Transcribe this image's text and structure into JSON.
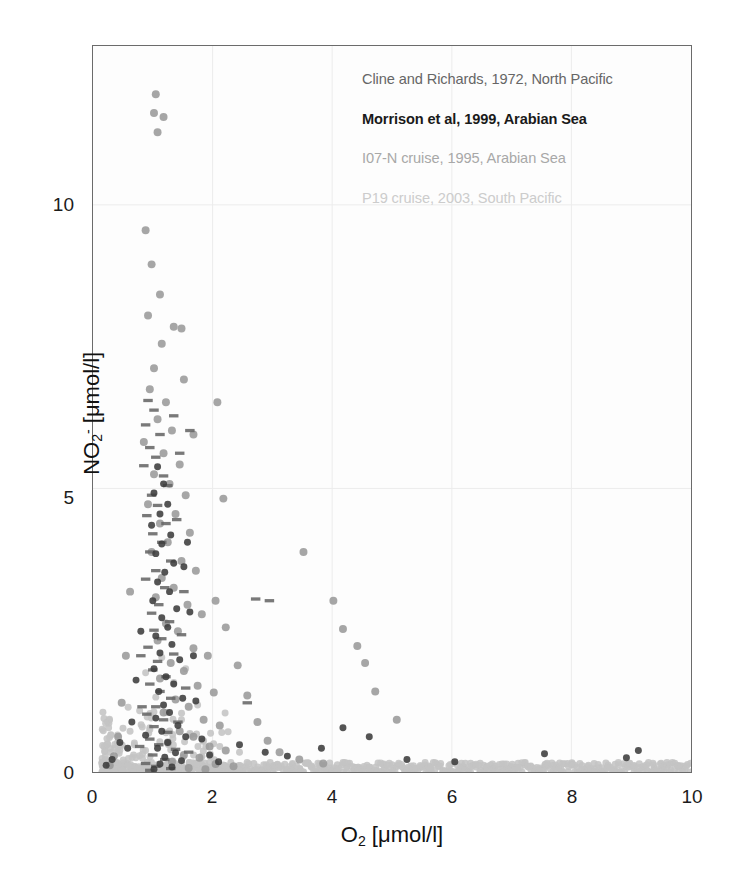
{
  "figure": {
    "background": "#ffffff",
    "plot_background": "#fdfdfd",
    "frame_color": "#6b6b6b"
  },
  "axes": {
    "x_tick_labels": [
      "0",
      "2",
      "4",
      "6",
      "8",
      "10"
    ],
    "y_tick_labels": [
      "0",
      "5",
      "10"
    ],
    "x_title_main": "O",
    "x_title_sub": "2",
    "x_title_unit": " [μmol/l]",
    "y_title_main": "NO",
    "y_title_sub": "2",
    "y_title_sup": "-",
    "y_title_unit": " [μmol/l]"
  },
  "legend": {
    "entries": [
      {
        "label": "Cline and Richards, 1972, North Pacific",
        "color": "#666666",
        "weight": "normal"
      },
      {
        "label": "Morrison et al, 1999, Arabian Sea",
        "color": "#1a1a1a",
        "weight": "bold"
      },
      {
        "label": "I07-N cruise, 1995, Arabian Sea",
        "color": "#a8a8a8",
        "weight": "normal"
      },
      {
        "label": "P19 cruise, 2003, South Pacific",
        "color": "#cccccc",
        "weight": "normal"
      }
    ]
  },
  "chart_data": {
    "type": "scatter",
    "title": "",
    "xlabel": "O2 [μmol/l]",
    "ylabel": "NO2- [μmol/l]",
    "xlim": [
      0,
      10
    ],
    "ylim": [
      0,
      12.8
    ],
    "grid": true,
    "grid_color": "#ececec",
    "legend_position": "upper-right-inside",
    "series": [
      {
        "name": "Cline and Richards, 1972, North Pacific",
        "color": "#666666",
        "marker": "dash",
        "size": 5,
        "points": [
          [
            0.92,
            6.55
          ],
          [
            1.02,
            6.38
          ],
          [
            0.88,
            6.12
          ],
          [
            1.12,
            5.95
          ],
          [
            0.95,
            5.72
          ],
          [
            1.05,
            5.55
          ],
          [
            0.85,
            5.4
          ],
          [
            1.18,
            5.22
          ],
          [
            1.25,
            5.05
          ],
          [
            0.98,
            4.88
          ],
          [
            1.08,
            4.7
          ],
          [
            0.9,
            4.52
          ],
          [
            1.22,
            4.38
          ],
          [
            1.0,
            4.2
          ],
          [
            1.15,
            4.05
          ],
          [
            0.95,
            3.88
          ],
          [
            1.3,
            3.72
          ],
          [
            1.05,
            3.55
          ],
          [
            0.88,
            3.4
          ],
          [
            1.2,
            3.25
          ],
          [
            2.72,
            3.05
          ],
          [
            2.95,
            3.02
          ],
          [
            1.1,
            2.95
          ],
          [
            0.98,
            2.8
          ],
          [
            1.28,
            2.65
          ],
          [
            1.02,
            2.5
          ],
          [
            1.15,
            2.35
          ],
          [
            0.92,
            2.2
          ],
          [
            1.35,
            2.08
          ],
          [
            1.08,
            1.95
          ],
          [
            1.0,
            1.8
          ],
          [
            1.22,
            1.68
          ],
          [
            0.95,
            1.55
          ],
          [
            1.12,
            1.42
          ],
          [
            1.3,
            1.3
          ],
          [
            2.58,
            1.22
          ],
          [
            1.05,
            1.15
          ],
          [
            0.9,
            1.02
          ],
          [
            1.18,
            0.92
          ],
          [
            1.02,
            0.8
          ],
          [
            1.25,
            0.7
          ],
          [
            0.95,
            0.58
          ],
          [
            1.1,
            0.48
          ],
          [
            1.38,
            0.4
          ],
          [
            1.0,
            0.3
          ],
          [
            1.2,
            0.22
          ],
          [
            0.88,
            0.15
          ],
          [
            1.05,
            0.1
          ],
          [
            1.3,
            0.06
          ],
          [
            0.95,
            0.03
          ],
          [
            1.45,
            5.62
          ],
          [
            1.4,
            4.45
          ],
          [
            1.52,
            3.18
          ],
          [
            1.48,
            2.42
          ],
          [
            1.55,
            1.48
          ],
          [
            1.42,
            0.88
          ],
          [
            1.6,
            0.35
          ],
          [
            0.8,
            2.05
          ],
          [
            0.82,
            1.15
          ],
          [
            0.78,
            0.45
          ],
          [
            1.62,
            6.02
          ],
          [
            1.35,
            6.28
          ]
        ]
      },
      {
        "name": "Morrison et al, 1999, Arabian Sea",
        "color": "#3c3c3c",
        "marker": "circle",
        "size": 7,
        "points": [
          [
            1.08,
            5.38
          ],
          [
            1.18,
            5.08
          ],
          [
            1.02,
            4.92
          ],
          [
            1.25,
            4.72
          ],
          [
            1.12,
            4.55
          ],
          [
            0.98,
            4.35
          ],
          [
            1.3,
            4.18
          ],
          [
            1.15,
            4.02
          ],
          [
            1.05,
            3.85
          ],
          [
            1.35,
            3.68
          ],
          [
            1.2,
            3.52
          ],
          [
            1.08,
            3.35
          ],
          [
            1.28,
            3.18
          ],
          [
            1.0,
            3.02
          ],
          [
            1.4,
            2.88
          ],
          [
            1.15,
            2.72
          ],
          [
            1.25,
            2.55
          ],
          [
            1.05,
            2.4
          ],
          [
            1.32,
            2.25
          ],
          [
            1.12,
            2.1
          ],
          [
            1.45,
            1.98
          ],
          [
            1.02,
            1.82
          ],
          [
            1.22,
            1.68
          ],
          [
            1.35,
            1.55
          ],
          [
            1.1,
            1.42
          ],
          [
            1.5,
            1.3
          ],
          [
            1.18,
            1.18
          ],
          [
            1.28,
            1.05
          ],
          [
            1.05,
            0.95
          ],
          [
            1.42,
            0.82
          ],
          [
            1.15,
            0.72
          ],
          [
            1.55,
            0.62
          ],
          [
            1.25,
            0.52
          ],
          [
            1.08,
            0.42
          ],
          [
            1.38,
            0.34
          ],
          [
            1.2,
            0.26
          ],
          [
            1.48,
            0.2
          ],
          [
            1.12,
            0.14
          ],
          [
            1.32,
            0.09
          ],
          [
            1.02,
            0.05
          ],
          [
            0.72,
            1.62
          ],
          [
            0.65,
            0.88
          ],
          [
            0.58,
            0.42
          ],
          [
            0.8,
            2.48
          ],
          [
            0.88,
            0.65
          ],
          [
            1.68,
            2.05
          ],
          [
            1.72,
            1.25
          ],
          [
            1.82,
            0.58
          ],
          [
            1.95,
            0.3
          ],
          [
            2.1,
            0.18
          ],
          [
            4.18,
            0.78
          ],
          [
            3.82,
            0.42
          ],
          [
            4.62,
            0.62
          ],
          [
            5.25,
            0.22
          ],
          [
            6.05,
            0.18
          ],
          [
            7.55,
            0.32
          ],
          [
            8.92,
            0.25
          ],
          [
            9.12,
            0.38
          ],
          [
            2.45,
            0.48
          ],
          [
            2.88,
            0.35
          ],
          [
            3.25,
            0.28
          ],
          [
            0.45,
            0.52
          ],
          [
            0.32,
            0.22
          ],
          [
            0.22,
            0.12
          ],
          [
            1.58,
            4.05
          ],
          [
            1.62,
            2.82
          ],
          [
            1.52,
            3.62
          ]
        ]
      },
      {
        "name": "I07-N cruise, 1995, Arabian Sea",
        "color": "#9a9a9a",
        "marker": "circle",
        "size": 8,
        "points": [
          [
            1.05,
            11.95
          ],
          [
            1.02,
            11.62
          ],
          [
            1.18,
            11.55
          ],
          [
            1.08,
            11.28
          ],
          [
            0.88,
            9.55
          ],
          [
            0.98,
            8.95
          ],
          [
            1.12,
            8.42
          ],
          [
            0.92,
            8.05
          ],
          [
            1.35,
            7.85
          ],
          [
            1.15,
            7.55
          ],
          [
            1.02,
            7.12
          ],
          [
            0.95,
            6.75
          ],
          [
            1.22,
            6.52
          ],
          [
            1.08,
            6.22
          ],
          [
            1.32,
            6.02
          ],
          [
            0.85,
            5.82
          ],
          [
            1.18,
            5.62
          ],
          [
            1.45,
            5.42
          ],
          [
            1.02,
            5.25
          ],
          [
            1.28,
            5.08
          ],
          [
            1.55,
            4.88
          ],
          [
            0.92,
            4.72
          ],
          [
            1.38,
            4.55
          ],
          [
            1.12,
            4.38
          ],
          [
            1.62,
            4.22
          ],
          [
            1.25,
            4.05
          ],
          [
            0.98,
            3.88
          ],
          [
            1.48,
            3.72
          ],
          [
            1.72,
            3.55
          ],
          [
            1.15,
            3.42
          ],
          [
            1.35,
            3.25
          ],
          [
            1.05,
            3.08
          ],
          [
            1.58,
            2.95
          ],
          [
            1.82,
            2.78
          ],
          [
            1.22,
            2.62
          ],
          [
            1.42,
            2.48
          ],
          [
            1.08,
            2.32
          ],
          [
            1.68,
            2.18
          ],
          [
            1.92,
            2.05
          ],
          [
            1.3,
            1.92
          ],
          [
            1.52,
            1.78
          ],
          [
            1.12,
            1.65
          ],
          [
            1.75,
            1.52
          ],
          [
            2.02,
            1.4
          ],
          [
            1.38,
            1.28
          ],
          [
            1.6,
            1.15
          ],
          [
            1.18,
            1.05
          ],
          [
            1.85,
            0.92
          ],
          [
            2.12,
            0.82
          ],
          [
            1.45,
            0.72
          ],
          [
            1.68,
            0.62
          ],
          [
            1.25,
            0.52
          ],
          [
            1.95,
            0.45
          ],
          [
            2.22,
            0.38
          ],
          [
            1.52,
            0.3
          ],
          [
            1.78,
            0.25
          ],
          [
            1.32,
            0.18
          ],
          [
            2.05,
            0.14
          ],
          [
            2.35,
            0.1
          ],
          [
            1.6,
            0.07
          ],
          [
            1.88,
            0.05
          ],
          [
            0.62,
            3.18
          ],
          [
            0.55,
            2.05
          ],
          [
            0.48,
            1.22
          ],
          [
            0.42,
            0.62
          ],
          [
            0.35,
            0.28
          ],
          [
            0.28,
            0.12
          ],
          [
            2.05,
            3.02
          ],
          [
            2.22,
            2.55
          ],
          [
            2.42,
            1.88
          ],
          [
            2.58,
            1.35
          ],
          [
            2.75,
            0.88
          ],
          [
            2.92,
            0.55
          ],
          [
            3.12,
            0.35
          ],
          [
            3.45,
            0.22
          ],
          [
            3.85,
            0.15
          ],
          [
            2.18,
            4.82
          ],
          [
            4.18,
            2.52
          ],
          [
            4.55,
            1.92
          ],
          [
            4.02,
            3.02
          ],
          [
            3.52,
            3.88
          ],
          [
            4.72,
            1.42
          ],
          [
            5.08,
            0.92
          ],
          [
            4.42,
            2.22
          ],
          [
            1.52,
            6.92
          ],
          [
            1.68,
            5.95
          ],
          [
            1.48,
            7.82
          ],
          [
            2.08,
            6.52
          ]
        ]
      },
      {
        "name": "P19 cruise, 2003, South Pacific",
        "color": "#c4c4c4",
        "marker": "circle",
        "size": 7,
        "points_note": "dense near-zero band spanning full O2 range, generated procedurally",
        "band": {
          "y_mean": 0.06,
          "y_spread": 0.09,
          "x_from": 0.15,
          "x_to": 10.0,
          "count": 520
        },
        "extra_points": [
          [
            1.22,
            1.05
          ],
          [
            1.48,
            0.92
          ],
          [
            1.05,
            1.32
          ],
          [
            0.95,
            0.78
          ],
          [
            1.62,
            0.68
          ],
          [
            1.85,
            0.55
          ],
          [
            2.12,
            0.45
          ],
          [
            0.78,
            1.08
          ],
          [
            0.62,
            0.72
          ],
          [
            2.45,
            0.35
          ],
          [
            1.35,
            1.58
          ],
          [
            1.15,
            2.02
          ],
          [
            1.55,
            1.82
          ],
          [
            1.75,
            1.18
          ],
          [
            0.88,
            1.75
          ]
        ]
      }
    ]
  }
}
